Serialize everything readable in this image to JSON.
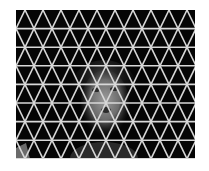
{
  "image": {
    "description": "Grayscale photo of a person's face behind a white triangular lattice on a black background",
    "background": "#ffffff",
    "panel": {
      "x": 16,
      "y": 10,
      "width": 179,
      "height": 149,
      "color": "#050505"
    },
    "grid": {
      "line_color": "#d8d8d8",
      "line_width": 1.6,
      "row_height": 18.6,
      "cell_width": 18.0,
      "rows": 8,
      "origin_x": 16,
      "origin_y": 10
    },
    "face": {
      "cx": 105,
      "cy": 103,
      "rx": 24,
      "ry": 33,
      "skin": "#8a8a8a",
      "hair": "#3a3a3a",
      "shadow": "#1a1a1a"
    },
    "corner_patch": {
      "x": 16,
      "y": 150,
      "color": "#6a6a6a"
    }
  }
}
